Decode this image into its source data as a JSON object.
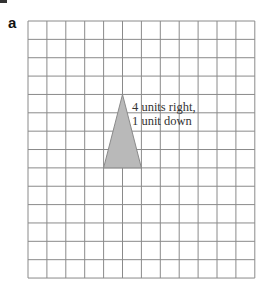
{
  "label": "a",
  "annotation": {
    "line1": "4 units right,",
    "line2": "1 unit down"
  },
  "grid": {
    "columns": 12,
    "rows": 14,
    "left": 28,
    "top": 21,
    "cell_width": 18.9,
    "cell_height": 18.36,
    "line_color": "#8a8a8a"
  },
  "triangle": {
    "vertices_grid": [
      [
        5,
        4
      ],
      [
        4,
        8
      ],
      [
        6,
        8
      ]
    ],
    "fill": "#b9b9b9",
    "stroke": "#8a8a8a"
  }
}
